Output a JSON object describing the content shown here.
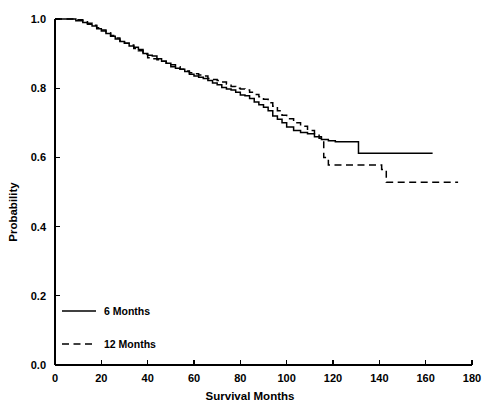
{
  "chart_data": {
    "type": "line",
    "title": "",
    "subtitle": "",
    "xlabel": "Survival Months",
    "ylabel": "Probability",
    "xlim": [
      0,
      180
    ],
    "ylim": [
      0.0,
      1.0
    ],
    "xticks": [
      0,
      20,
      40,
      60,
      80,
      100,
      120,
      140,
      160,
      180
    ],
    "xtick_labels": [
      "0",
      "20",
      "40",
      "60",
      "80",
      "100",
      "120",
      "140",
      "160",
      "180"
    ],
    "yticks": [
      0.0,
      0.2,
      0.4,
      0.6,
      0.8,
      1.0
    ],
    "ytick_labels": [
      "0.0",
      "0.2",
      "0.4",
      "0.6",
      "0.8",
      "1.0"
    ],
    "grid": false,
    "legend_position": "lower-left-inside",
    "curve_style": "step-post",
    "series": [
      {
        "name": "6 Months",
        "line_style": "solid",
        "color": "#000000",
        "points": [
          [
            0,
            1.0
          ],
          [
            7,
            1.0
          ],
          [
            9,
            0.995
          ],
          [
            12,
            0.99
          ],
          [
            14,
            0.985
          ],
          [
            16,
            0.98
          ],
          [
            18,
            0.972
          ],
          [
            20,
            0.965
          ],
          [
            22,
            0.958
          ],
          [
            24,
            0.95
          ],
          [
            26,
            0.942
          ],
          [
            28,
            0.935
          ],
          [
            30,
            0.93
          ],
          [
            32,
            0.922
          ],
          [
            34,
            0.918
          ],
          [
            36,
            0.912
          ],
          [
            38,
            0.9
          ],
          [
            40,
            0.895
          ],
          [
            42,
            0.893
          ],
          [
            44,
            0.885
          ],
          [
            46,
            0.878
          ],
          [
            48,
            0.872
          ],
          [
            50,
            0.862
          ],
          [
            52,
            0.858
          ],
          [
            54,
            0.855
          ],
          [
            56,
            0.848
          ],
          [
            58,
            0.84
          ],
          [
            60,
            0.835
          ],
          [
            62,
            0.832
          ],
          [
            64,
            0.828
          ],
          [
            66,
            0.822
          ],
          [
            68,
            0.815
          ],
          [
            70,
            0.81
          ],
          [
            72,
            0.802
          ],
          [
            74,
            0.798
          ],
          [
            76,
            0.795
          ],
          [
            78,
            0.788
          ],
          [
            80,
            0.78
          ],
          [
            82,
            0.778
          ],
          [
            84,
            0.77
          ],
          [
            86,
            0.76
          ],
          [
            88,
            0.752
          ],
          [
            90,
            0.745
          ],
          [
            92,
            0.735
          ],
          [
            94,
            0.72
          ],
          [
            96,
            0.71
          ],
          [
            98,
            0.7
          ],
          [
            100,
            0.688
          ],
          [
            103,
            0.678
          ],
          [
            106,
            0.672
          ],
          [
            109,
            0.668
          ],
          [
            112,
            0.66
          ],
          [
            115,
            0.652
          ],
          [
            118,
            0.648
          ],
          [
            121,
            0.645
          ],
          [
            124,
            0.645
          ],
          [
            127,
            0.645
          ],
          [
            129,
            0.645
          ],
          [
            131,
            0.612
          ],
          [
            140,
            0.612
          ],
          [
            150,
            0.612
          ],
          [
            160,
            0.612
          ],
          [
            163,
            0.612
          ]
        ]
      },
      {
        "name": "12 Months",
        "line_style": "dashed",
        "color": "#000000",
        "points": [
          [
            0,
            1.0
          ],
          [
            7,
            1.0
          ],
          [
            9,
            0.998
          ],
          [
            12,
            0.995
          ],
          [
            14,
            0.988
          ],
          [
            16,
            0.982
          ],
          [
            18,
            0.975
          ],
          [
            20,
            0.968
          ],
          [
            22,
            0.96
          ],
          [
            24,
            0.952
          ],
          [
            26,
            0.945
          ],
          [
            28,
            0.938
          ],
          [
            30,
            0.93
          ],
          [
            32,
            0.925
          ],
          [
            34,
            0.915
          ],
          [
            36,
            0.908
          ],
          [
            38,
            0.898
          ],
          [
            40,
            0.888
          ],
          [
            42,
            0.885
          ],
          [
            44,
            0.882
          ],
          [
            46,
            0.878
          ],
          [
            48,
            0.872
          ],
          [
            50,
            0.868
          ],
          [
            52,
            0.862
          ],
          [
            54,
            0.855
          ],
          [
            56,
            0.85
          ],
          [
            58,
            0.845
          ],
          [
            60,
            0.842
          ],
          [
            62,
            0.838
          ],
          [
            64,
            0.835
          ],
          [
            66,
            0.828
          ],
          [
            68,
            0.825
          ],
          [
            70,
            0.822
          ],
          [
            72,
            0.818
          ],
          [
            74,
            0.812
          ],
          [
            76,
            0.805
          ],
          [
            78,
            0.8
          ],
          [
            80,
            0.798
          ],
          [
            82,
            0.795
          ],
          [
            84,
            0.788
          ],
          [
            86,
            0.782
          ],
          [
            88,
            0.775
          ],
          [
            90,
            0.768
          ],
          [
            92,
            0.758
          ],
          [
            94,
            0.748
          ],
          [
            96,
            0.735
          ],
          [
            98,
            0.722
          ],
          [
            100,
            0.712
          ],
          [
            103,
            0.7
          ],
          [
            106,
            0.69
          ],
          [
            109,
            0.678
          ],
          [
            112,
            0.668
          ],
          [
            114,
            0.655
          ],
          [
            116,
            0.6
          ],
          [
            118,
            0.578
          ],
          [
            121,
            0.578
          ],
          [
            125,
            0.578
          ],
          [
            130,
            0.578
          ],
          [
            135,
            0.578
          ],
          [
            139,
            0.578
          ],
          [
            141,
            0.565
          ],
          [
            143,
            0.528
          ],
          [
            150,
            0.528
          ],
          [
            160,
            0.528
          ],
          [
            170,
            0.528
          ],
          [
            174,
            0.528
          ]
        ]
      }
    ],
    "legend": [
      {
        "label": "6 Months",
        "line_style": "solid"
      },
      {
        "label": "12 Months",
        "line_style": "dashed"
      }
    ]
  }
}
